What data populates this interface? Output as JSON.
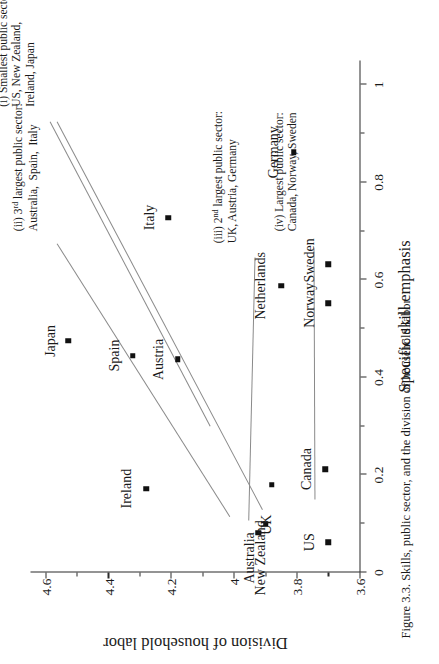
{
  "figure": {
    "caption": "Figure 3.3. Skills, public sector, and the division of household labor"
  },
  "chart_data": {
    "type": "scatter",
    "title": "",
    "xlabel": "Specific skill emphasis",
    "ylabel": "Division of household labor",
    "xlim": [
      0,
      1.05
    ],
    "ylim": [
      3.6,
      4.65
    ],
    "xticks": [
      "0",
      "0.2",
      "0.4",
      "0.6",
      "0.8",
      "1"
    ],
    "xtick_values": [
      0,
      0.2,
      0.4,
      0.6,
      0.8,
      1
    ],
    "yticks": [
      "3.6",
      "3.8",
      "4",
      "4.2",
      "4.4",
      "4.6"
    ],
    "ytick_values": [
      3.6,
      3.8,
      4.0,
      4.2,
      4.4,
      4.6
    ],
    "grid": false,
    "legend": "none",
    "points": [
      {
        "label": "Japan",
        "x": 0.475,
        "y": 4.53,
        "lx": 0.475,
        "ly": 4.585
      },
      {
        "label": "Spain",
        "x": 0.445,
        "y": 4.325,
        "lx": 0.445,
        "ly": 4.383
      },
      {
        "label": "Ireland",
        "x": 0.172,
        "y": 4.282,
        "lx": 0.172,
        "ly": 4.345
      },
      {
        "label": "Italy",
        "x": 0.728,
        "y": 4.212,
        "lx": 0.728,
        "ly": 4.272
      },
      {
        "label": "Austria",
        "x": 0.437,
        "y": 4.182,
        "lx": 0.437,
        "ly": 4.243
      },
      {
        "label": "Australia",
        "x": 0.082,
        "y": 3.925,
        "lx": 0.03,
        "ly": 3.952
      },
      {
        "label": "New Zealand",
        "x": 0.1,
        "y": 3.902,
        "lx": 0.03,
        "ly": 3.918
      },
      {
        "label": "UK",
        "x": 0.18,
        "y": 3.882,
        "lx": 0.098,
        "ly": 3.898
      },
      {
        "label": "Netherlands",
        "x": 0.588,
        "y": 3.852,
        "lx": 0.588,
        "ly": 3.918
      },
      {
        "label": "Germany",
        "x": 0.862,
        "y": 3.812,
        "lx": 0.862,
        "ly": 3.878
      },
      {
        "label": "Canada",
        "x": 0.212,
        "y": 3.712,
        "lx": 0.212,
        "ly": 3.772
      },
      {
        "label": "Sweden",
        "x": 0.632,
        "y": 3.702,
        "lx": 0.64,
        "ly": 3.762
      },
      {
        "label": "Norway",
        "x": 0.552,
        "y": 3.702,
        "lx": 0.548,
        "ly": 3.762
      },
      {
        "label": "US",
        "x": 0.062,
        "y": 3.702,
        "lx": 0.062,
        "ly": 3.762
      }
    ],
    "annotations": [
      {
        "id": "i",
        "line1": "(i) Smallest public sector:",
        "line2": "US, New Zealand,",
        "line3": "Ireland, Japan"
      },
      {
        "id": "ii",
        "line1": "(ii) 3rd largest public sector:",
        "line2": "Australia,  Spain,  Italy",
        "line3": ""
      },
      {
        "id": "iii",
        "line1": "(iii) 2nd largest public sector:",
        "line2": "UK, Austria, Germany",
        "line3": ""
      },
      {
        "id": "iv",
        "line1": "(iv) Largest public sector:",
        "line2": "Canada, Norway, Sweden",
        "line3": ""
      }
    ],
    "annotation_markup": {
      "ii_prefix": "(ii) 3",
      "ii_sup": "rd",
      "ii_rest": " largest public sector:",
      "ii_line2": "Australia,  Spain,  Italy",
      "iii_prefix": "(iii) 2",
      "iii_sup": "nd",
      "iii_rest": " largest public sector:",
      "iii_line2": "UK, Austria, Germany"
    },
    "colors": {
      "marker": "#111111",
      "axis": "#2b2b2b",
      "leader": "#8a8a8a",
      "background": "#ffffff"
    }
  }
}
